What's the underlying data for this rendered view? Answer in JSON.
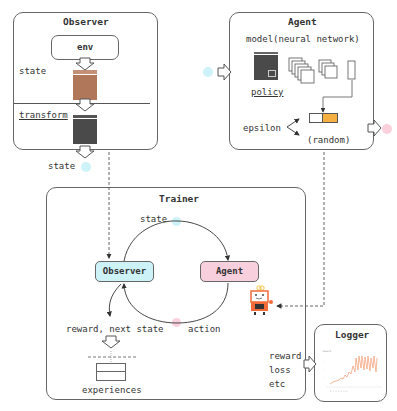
{
  "observer": {
    "title": "Observer",
    "env_label": "env",
    "state_label": "state",
    "transform_label": "transform",
    "output_label": "state"
  },
  "agent": {
    "title": "Agent",
    "model_label": "model(neural network)",
    "policy_label": "policy",
    "epsilon_label": "epsilon",
    "random_label": "(random)"
  },
  "trainer": {
    "title": "Trainer",
    "state_label": "state",
    "observer_node": "Observer",
    "agent_node": "Agent",
    "action_label": "action",
    "reward_label": "reward, next state",
    "experiences_label": "experiences"
  },
  "logger": {
    "title": "Logger",
    "metrics": [
      "reward",
      "loss",
      "etc"
    ]
  },
  "colors": {
    "state_dot": "#cdf2f7",
    "action_dot": "#f9d0dc",
    "observer_node_fill": "#cdf2f8",
    "agent_node_fill": "#f8cfdc",
    "env_frame": "#b0775a",
    "transformed_frame": "#4a4a4a",
    "action_highlight": "#f5b041",
    "robot": "#f26b38",
    "chart_line": "#f4a582"
  },
  "icons": [
    "hollow-arrow-icon",
    "robot-icon",
    "line-chart-icon",
    "feature-map-icon"
  ]
}
